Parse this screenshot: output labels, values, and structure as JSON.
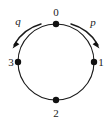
{
  "figure": {
    "type": "cycle-graph-diagram",
    "background_color": "#ffffff",
    "stroke_color": "#1a1a1a",
    "circle": {
      "center_x": 56,
      "center_y": 62,
      "radius": 38
    },
    "nodes": [
      {
        "id": "node-0",
        "label": "0",
        "angle_deg": 90,
        "cx": 56,
        "cy": 24,
        "label_x": 56,
        "label_y": 16,
        "label_anchor": "middle"
      },
      {
        "id": "node-1",
        "label": "1",
        "angle_deg": 0,
        "cx": 94,
        "cy": 62,
        "label_x": 101,
        "label_y": 66,
        "label_anchor": "middle"
      },
      {
        "id": "node-2",
        "label": "2",
        "angle_deg": 270,
        "cx": 56,
        "cy": 100,
        "label_x": 56,
        "label_y": 115,
        "label_anchor": "middle"
      },
      {
        "id": "node-3",
        "label": "3",
        "angle_deg": 180,
        "cx": 18,
        "cy": 62,
        "label_x": 11,
        "label_y": 66,
        "label_anchor": "middle"
      }
    ],
    "generators": [
      {
        "id": "generator-p",
        "label": "p",
        "direction": "clockwise",
        "label_x": 93,
        "label_y": 26,
        "arc_path": "M 72 26 A 44 44 0 0 1 97 46",
        "arrow_points": "97,47 91,42 93,38"
      },
      {
        "id": "generator-q",
        "label": "q",
        "direction": "counterclockwise",
        "label_x": 17,
        "label_y": 25,
        "arc_path": "M 40 26 A 44 44 0 0 0 15 46",
        "arrow_points": "15,47 21,42 19,38"
      }
    ]
  }
}
